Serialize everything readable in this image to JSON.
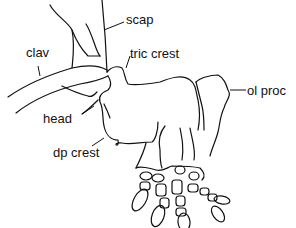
{
  "figure": {
    "labels": {
      "scap": "scap",
      "clav": "clav",
      "tric_crest": "tric crest",
      "ol_proc": "ol proc",
      "head": "head",
      "dp_crest": "dp crest"
    },
    "colors": {
      "line": "#111111",
      "background": "#ffffff"
    }
  }
}
